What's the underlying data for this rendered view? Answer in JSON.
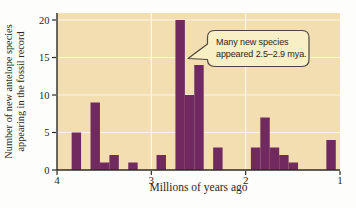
{
  "chart_data": {
    "type": "bar",
    "title": "",
    "xlabel": "Millions of years ago",
    "ylabel_line1": "Number of new antelope species",
    "ylabel_line2": "appearing in the fossil record",
    "x_axis": {
      "min": 4,
      "max": 1,
      "direction": "reversed",
      "ticks": [
        4,
        3,
        2,
        1
      ]
    },
    "y_axis": {
      "min": 0,
      "max": 20.8,
      "ticks": [
        0,
        5,
        10,
        15,
        20
      ]
    },
    "bin_width_mya": 0.1,
    "grid": true,
    "bars": [
      {
        "mya": 3.8,
        "count": 5
      },
      {
        "mya": 3.6,
        "count": 9
      },
      {
        "mya": 3.5,
        "count": 1
      },
      {
        "mya": 3.4,
        "count": 2
      },
      {
        "mya": 3.2,
        "count": 1
      },
      {
        "mya": 2.9,
        "count": 2
      },
      {
        "mya": 2.7,
        "count": 20
      },
      {
        "mya": 2.6,
        "count": 10
      },
      {
        "mya": 2.5,
        "count": 14
      },
      {
        "mya": 2.3,
        "count": 3
      },
      {
        "mya": 1.9,
        "count": 3
      },
      {
        "mya": 1.8,
        "count": 7
      },
      {
        "mya": 1.7,
        "count": 3
      },
      {
        "mya": 1.6,
        "count": 2
      },
      {
        "mya": 1.5,
        "count": 1
      },
      {
        "mya": 1.1,
        "count": 4
      }
    ],
    "annotation": {
      "line1": "Many new species",
      "line2": "appeared 2.5–2.9 mya.",
      "points_to_mya": 2.6
    },
    "colors": {
      "bar": "#702a60",
      "plot_background": "#f3deb1",
      "grid": "#fcf6e8",
      "axis": "#2f2a24",
      "callout_fill": "#f9efc5",
      "callout_border": "#4d483c",
      "text": "#2a2620"
    }
  }
}
